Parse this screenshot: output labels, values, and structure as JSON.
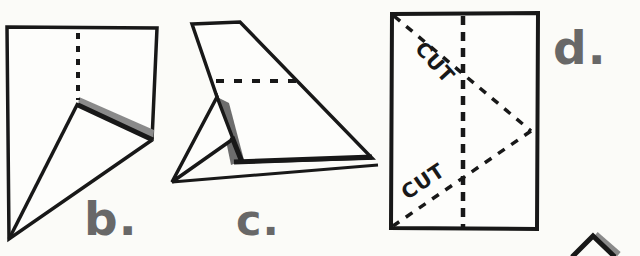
{
  "figure": {
    "colors": {
      "background": "#fbfbf8",
      "ink": "#181818",
      "shade": "#8a8a8a",
      "shade_dark": "#6d6d6d",
      "label_gray": "#686868"
    },
    "steps": [
      {
        "id": "b",
        "label": "b."
      },
      {
        "id": "c",
        "label": "c."
      },
      {
        "id": "d",
        "label": "d."
      }
    ],
    "cut_labels": {
      "upper": "CUT",
      "lower": "CUT"
    }
  }
}
